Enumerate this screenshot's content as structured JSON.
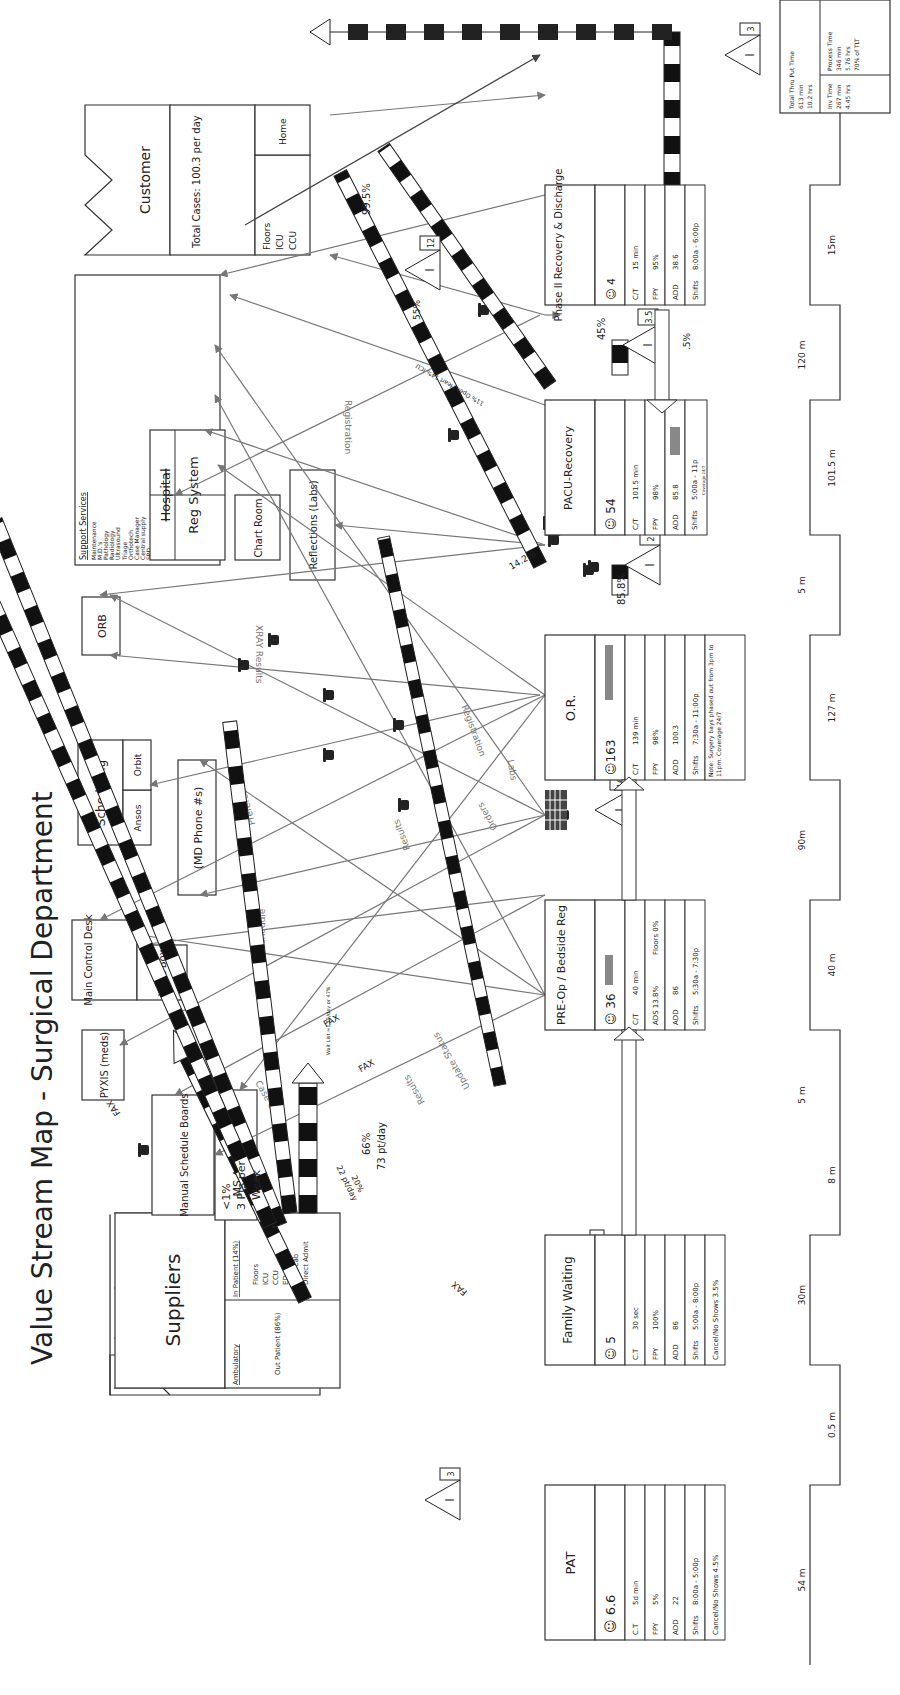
{
  "title": "Value Stream Map - Surgical Department",
  "suppliers": {
    "label": "Suppliers",
    "inpatient_header": "In Patient (14%)",
    "inpatient_items": [
      "Floors",
      "ICU",
      "CCU",
      "ED",
      "Cath Lab",
      "Direct Admit"
    ],
    "ambulatory_header": "Ambulatory",
    "outpatient": "Out Patient (86%)"
  },
  "customer": {
    "label": "Customer",
    "total_cases": "Total Cases: 100.3 per day",
    "destinations_a": [
      "Floors",
      "ICU",
      "CCU"
    ],
    "destinations_b": "Home"
  },
  "support_services": {
    "header": "Support Services",
    "items": [
      "Maintenance",
      "M.D.'s",
      "Pathology",
      "Radiology",
      "Ultrasound",
      "Triage",
      "Orthotech",
      "Case Manager",
      "Central supply",
      "SPD",
      "Open Heart Rec.",
      "Bed Scheduling",
      "Lab Up & Down",
      "Pharmacy",
      "Resp. Therapy",
      "Medical Records",
      "Family Wait",
      "External testing",
      "MD Offices",
      "Floors",
      "Valet"
    ]
  },
  "info_systems": {
    "orb": "ORB",
    "scheduling": "Scheduling",
    "orbit": "Orbit",
    "ansos": "Ansos",
    "main_control_desk": "Main Control Desk",
    "light_box": "Light Box",
    "pyxis": "PYXIS (meds)",
    "manual_schedule_boards": "Manual Schedule Boards",
    "ms_access_spd": "MS Access SPD",
    "md_phone": "(MD Phone #s)",
    "hospital_reg_system_struck": "Hospital",
    "hospital_reg_system": "Reg System",
    "chart_room": "Chart Room",
    "reflections": "Reflections (Labs)"
  },
  "flow_labels": {
    "registration_1": "Registration",
    "registration_2": "Registration",
    "xray_results": "XRAY Results",
    "preferences": "Preferences",
    "schedule": "Schedule",
    "results_1": "Results",
    "results_2": "Results",
    "orders": "Orders",
    "labs": "Labs",
    "case_carts": "Case Carts",
    "update_status": "Update Status",
    "fax_1": "FAX",
    "fax_2": "FAX",
    "fax_3": "FAX",
    "fax_4": "FAX"
  },
  "push_labels": {
    "pat_pct": "20%",
    "pat_rate": "22 pt/day",
    "family_pct": "66%",
    "family_rate": "73 pt/day",
    "week_pct": "<1%",
    "week_rate": "3 Pts per",
    "week_unit": "Week",
    "waitlist": "Wait List ≈1.15/day or 47%",
    "or_pct": "14.2%",
    "or_to_pacu": "85.8%",
    "openheart": "11% Open Heart 14% ICU",
    "pacu_55": "55%",
    "pacu_45": "45%",
    "pacu_5": ".5%",
    "customer_pct": "99.5%"
  },
  "inventory": [
    {
      "id": "inv-pat",
      "value": "3"
    },
    {
      "id": "inv-preop",
      "value": "2"
    },
    {
      "id": "inv-or",
      "value": "16"
    },
    {
      "id": "inv-pacu",
      "value": "2"
    },
    {
      "id": "inv-customer-12",
      "value": "12"
    },
    {
      "id": "inv-phase2",
      "value": "3.5"
    },
    {
      "id": "inv-final",
      "value": "3"
    }
  ],
  "processes": [
    {
      "name": "PAT",
      "operators": "6.6",
      "rows": [
        [
          "C.T",
          "5d min"
        ],
        [
          "FPY",
          "5%"
        ],
        [
          "ADD",
          "22"
        ],
        [
          "Shifts",
          "8:00a - 5:00p"
        ]
      ],
      "note": "Cancel/No Shows 4.5%"
    },
    {
      "name": "Family Waiting",
      "operators": "5",
      "rows": [
        [
          "C.T",
          "30 sec"
        ],
        [
          "FPY",
          "100%"
        ],
        [
          "ADD",
          "86"
        ],
        [
          "Shifts",
          "5:00a - 8:00p"
        ]
      ],
      "note": "Cancel/No Shows 3.5%"
    },
    {
      "name": "PRE-Op / Bedside Reg",
      "operators": "36",
      "rows": [
        [
          "C/T",
          "40 min"
        ],
        [
          "ADS 13.8%",
          "Floors 0%"
        ],
        [
          "ADD",
          "86"
        ],
        [
          "Shifts",
          "5:30a - 7:30p"
        ]
      ],
      "fpy_label": "FPY"
    },
    {
      "name": "O.R.",
      "operators": "163",
      "rows": [
        [
          "C/T",
          "139 min"
        ],
        [
          "FPY",
          "98%"
        ],
        [
          "ADD",
          "100.3"
        ],
        [
          "Shifts",
          "7:30a - 11:00p"
        ]
      ],
      "note": "Note: Surgery bays phased out from 3pm to 11pm. Coverage 24/7"
    },
    {
      "name": "PACU-Recovery",
      "operators": "54",
      "rows": [
        [
          "C/T",
          "101.5 min"
        ],
        [
          "FPY",
          "98%"
        ],
        [
          "ADD",
          "85.8"
        ],
        [
          "Shifts",
          "5:00a - 11p"
        ]
      ],
      "coverage": "Coverage 24/7"
    },
    {
      "name": "Phase II Recovery & Discharge",
      "operators": "4",
      "rows": [
        [
          "C/T",
          "15 min"
        ],
        [
          "FPY",
          "95%"
        ],
        [
          "ADD",
          "38.6"
        ],
        [
          "Shifts",
          "8:00a - 6:00p"
        ]
      ]
    }
  ],
  "timeline": {
    "waits": [
      "54 m",
      "30m",
      "5 m",
      "90m",
      "5 m",
      "120 m",
      "17m"
    ],
    "processes": [
      "0.5 m",
      "8 m",
      "40 m",
      "127 m",
      "101.5 m",
      "15m"
    ]
  },
  "summary": {
    "total_label": "Total Thru Put Time",
    "total_min": "613 min",
    "total_hrs": "10.2 hrs",
    "inv_label": "Inv Time",
    "inv_min": "267 min",
    "inv_hrs": "4.45 hrs",
    "proc_label": "Process Time",
    "proc_min": "346 min",
    "proc_hrs": "5.76 hrs",
    "proc_pct": "70% of TLT"
  }
}
